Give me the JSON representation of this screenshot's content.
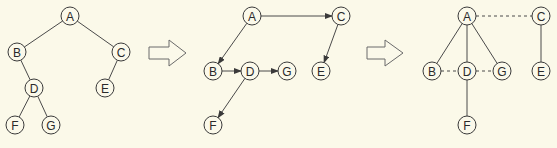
{
  "diagram": {
    "colors": {
      "background": "#fbf9e9",
      "stroke": "#3a3a3a",
      "node_fill": "#fbf9ea"
    },
    "panels": [
      {
        "name": "binary-tree",
        "nodes": [
          {
            "id": "A",
            "label": "A",
            "x": 70,
            "y": 16
          },
          {
            "id": "B",
            "label": "B",
            "x": 17,
            "y": 52
          },
          {
            "id": "C",
            "label": "C",
            "x": 121,
            "y": 52
          },
          {
            "id": "D",
            "label": "D",
            "x": 34,
            "y": 88
          },
          {
            "id": "E",
            "label": "E",
            "x": 105,
            "y": 88
          },
          {
            "id": "F",
            "label": "F",
            "x": 15,
            "y": 125
          },
          {
            "id": "G",
            "label": "G",
            "x": 51,
            "y": 125
          }
        ],
        "edges": [
          {
            "from": "A",
            "to": "B",
            "style": "solid"
          },
          {
            "from": "A",
            "to": "C",
            "style": "solid"
          },
          {
            "from": "B",
            "to": "D",
            "style": "solid"
          },
          {
            "from": "C",
            "to": "E",
            "style": "solid"
          },
          {
            "from": "D",
            "to": "F",
            "style": "solid"
          },
          {
            "from": "D",
            "to": "G",
            "style": "solid"
          }
        ]
      },
      {
        "name": "directed-graph",
        "nodes": [
          {
            "id": "A",
            "label": "A",
            "x": 252,
            "y": 16
          },
          {
            "id": "C",
            "label": "C",
            "x": 341,
            "y": 16
          },
          {
            "id": "B",
            "label": "B",
            "x": 213,
            "y": 71
          },
          {
            "id": "D",
            "label": "D",
            "x": 250,
            "y": 71
          },
          {
            "id": "G",
            "label": "G",
            "x": 287,
            "y": 71
          },
          {
            "id": "E",
            "label": "E",
            "x": 321,
            "y": 71
          },
          {
            "id": "F",
            "label": "F",
            "x": 213,
            "y": 125
          }
        ],
        "edges": [
          {
            "from": "A",
            "to": "C",
            "style": "arrow"
          },
          {
            "from": "A",
            "to": "B",
            "style": "arrow"
          },
          {
            "from": "C",
            "to": "E",
            "style": "arrow"
          },
          {
            "from": "B",
            "to": "D",
            "style": "arrow"
          },
          {
            "from": "D",
            "to": "G",
            "style": "arrow"
          },
          {
            "from": "D",
            "to": "F",
            "style": "arrow"
          }
        ]
      },
      {
        "name": "undirected-graph",
        "nodes": [
          {
            "id": "A",
            "label": "A",
            "x": 467,
            "y": 16
          },
          {
            "id": "C",
            "label": "C",
            "x": 541,
            "y": 16
          },
          {
            "id": "B",
            "label": "B",
            "x": 432,
            "y": 71
          },
          {
            "id": "D",
            "label": "D",
            "x": 467,
            "y": 71
          },
          {
            "id": "G",
            "label": "G",
            "x": 502,
            "y": 71
          },
          {
            "id": "E",
            "label": "E",
            "x": 541,
            "y": 71
          },
          {
            "id": "F",
            "label": "F",
            "x": 467,
            "y": 125
          }
        ],
        "edges": [
          {
            "from": "A",
            "to": "C",
            "style": "dashed"
          },
          {
            "from": "A",
            "to": "B",
            "style": "solid"
          },
          {
            "from": "A",
            "to": "D",
            "style": "solid"
          },
          {
            "from": "A",
            "to": "G",
            "style": "solid"
          },
          {
            "from": "C",
            "to": "E",
            "style": "solid"
          },
          {
            "from": "B",
            "to": "D",
            "style": "dashed"
          },
          {
            "from": "D",
            "to": "G",
            "style": "dashed"
          },
          {
            "from": "D",
            "to": "F",
            "style": "solid"
          }
        ]
      }
    ],
    "transition_arrows": [
      {
        "name": "arrow-1",
        "shaft_x0": 149,
        "shaft_x1": 169,
        "tip_x": 186,
        "cy": 53
      },
      {
        "name": "arrow-2",
        "shaft_x0": 367,
        "shaft_x1": 385,
        "tip_x": 403,
        "cy": 53
      }
    ]
  }
}
